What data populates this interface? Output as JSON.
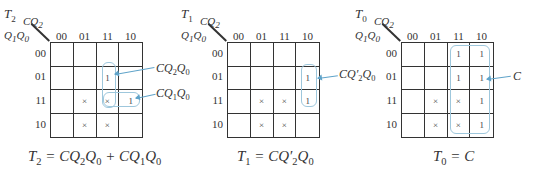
{
  "col_labels": [
    "00",
    "01",
    "11",
    "10"
  ],
  "row_labels": [
    "00",
    "01",
    "11",
    "10"
  ],
  "col_var": "CQ",
  "col_var_sub": "2",
  "row_var_a": "Q",
  "row_var_a_sub": "1",
  "row_var_b": "Q",
  "row_var_b_sub": "0",
  "maps": [
    {
      "output": "T",
      "output_sub": "2",
      "cells": [
        [
          "",
          "",
          "",
          ""
        ],
        [
          "",
          "",
          "1",
          ""
        ],
        [
          "",
          "×",
          "×",
          "1"
        ],
        [
          "",
          "×",
          "×",
          ""
        ]
      ],
      "annotations": [
        {
          "text": "CQ",
          "sub1": "2",
          "mid": "Q",
          "sub2": "0"
        },
        {
          "text": "CQ",
          "sub1": "1",
          "mid": "Q",
          "sub2": "0"
        }
      ],
      "equation": {
        "lhs": "T",
        "lhs_sub": "2",
        "p1": " = CQ",
        "s1": "2",
        "p2": "Q",
        "s2": "0",
        "p3": " + CQ",
        "s3": "1",
        "p4": "Q",
        "s4": "0"
      }
    },
    {
      "output": "T",
      "output_sub": "1",
      "cells": [
        [
          "",
          "",
          "",
          ""
        ],
        [
          "",
          "",
          "",
          "1"
        ],
        [
          "",
          "×",
          "×",
          "1"
        ],
        [
          "",
          "×",
          "×",
          ""
        ]
      ],
      "annotations": [
        {
          "text": "CQ′",
          "sub1": "2",
          "mid": "Q",
          "sub2": "0"
        }
      ],
      "equation": {
        "lhs": "T",
        "lhs_sub": "1",
        "p1": " = CQ′",
        "s1": "2",
        "p2": "Q",
        "s2": "0"
      }
    },
    {
      "output": "T",
      "output_sub": "0",
      "cells": [
        [
          "",
          "",
          "1",
          "1"
        ],
        [
          "",
          "",
          "1",
          "1"
        ],
        [
          "",
          "×",
          "×",
          "1"
        ],
        [
          "",
          "×",
          "×",
          "1"
        ]
      ],
      "annotations": [
        {
          "text": "C"
        }
      ],
      "equation": {
        "lhs": "T",
        "lhs_sub": "0",
        "p1": " = C"
      }
    }
  ],
  "colors": {
    "line": "#333333",
    "loop": "#9ec7dc",
    "arrow": "#5fa3c9"
  }
}
